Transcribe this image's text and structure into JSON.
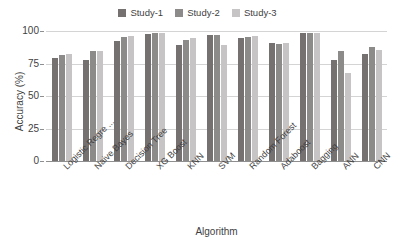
{
  "chart_data": {
    "type": "bar",
    "title": "",
    "xlabel": "Algorithm",
    "ylabel": "Accuracy (%)",
    "ylim": [
      0,
      100
    ],
    "yticks": [
      0,
      25,
      50,
      75,
      100
    ],
    "grid": true,
    "legend_position": "top-center",
    "categories": [
      "Logistic Regre ...",
      "Naive Bayes",
      "Decision Tree",
      "XG Boost",
      "KNN",
      "SVM",
      "Random Forest",
      "Adaboost",
      "Bagging",
      "ANN",
      "CNN"
    ],
    "series": [
      {
        "name": "Study-1",
        "color": "#767171",
        "values": [
          79.5,
          77.5,
          92.5,
          98.0,
          89.5,
          97.0,
          94.5,
          90.5,
          98.5,
          77.5,
          82.0
        ]
      },
      {
        "name": "Study-2",
        "color": "#8D8A8A",
        "values": [
          81.5,
          84.5,
          95.5,
          98.5,
          93.0,
          97.0,
          95.5,
          90.0,
          98.5,
          85.0,
          87.5
        ]
      },
      {
        "name": "Study-3",
        "color": "#C6C4C4",
        "values": [
          82.0,
          84.5,
          96.5,
          98.5,
          94.5,
          89.0,
          96.5,
          91.0,
          98.5,
          68.0,
          85.5
        ]
      }
    ]
  },
  "legend": {
    "entries": [
      {
        "label": "Study-1",
        "color": "#767171"
      },
      {
        "label": "Study-2",
        "color": "#8D8A8A"
      },
      {
        "label": "Study-3",
        "color": "#C6C4C4"
      }
    ]
  },
  "colors": {
    "gridline": "#d4d4d4",
    "axis": "#8f8f8f",
    "text": "#3f3f3f",
    "background": "#ffffff"
  }
}
